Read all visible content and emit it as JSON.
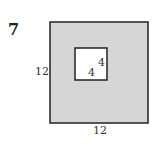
{
  "problem_number": "7",
  "figure": {
    "outer_square": {
      "side_label_left": "12",
      "side_label_bottom": "12",
      "fill": "#d6d6d6",
      "stroke": "#222222"
    },
    "inner_square": {
      "side_label_right": "4",
      "side_label_bottom": "4",
      "fill": "#ffffff",
      "stroke": "#222222"
    }
  }
}
